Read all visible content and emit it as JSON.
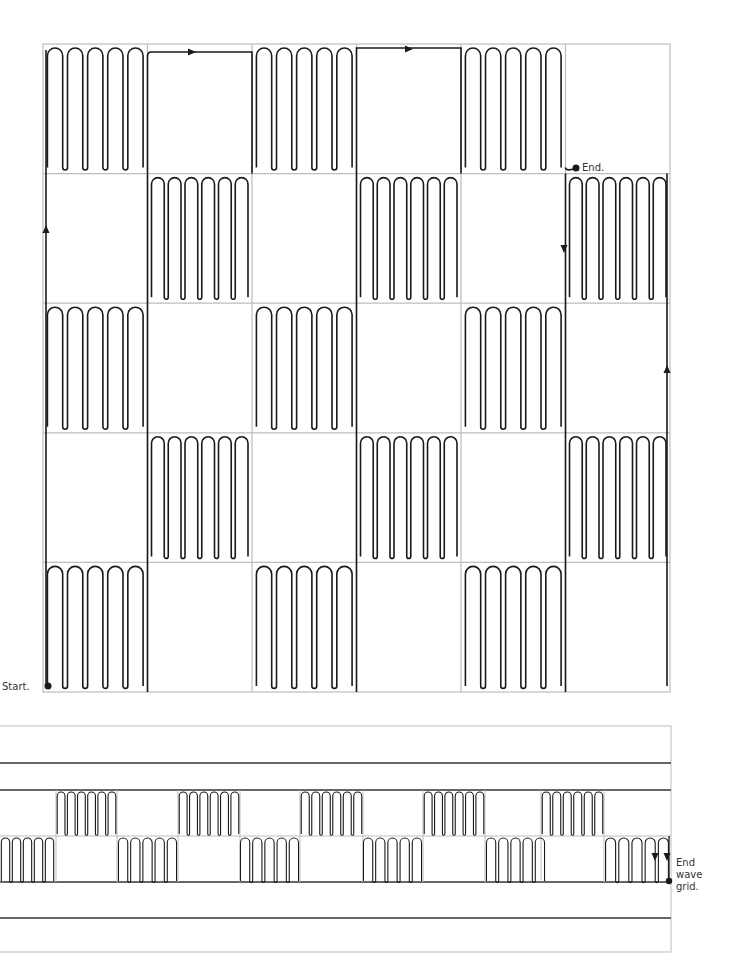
{
  "colors": {
    "grid": "#bdbdbd",
    "wave": "#1a1a1a",
    "strip_line": "#333333",
    "frame": "#c8c8c8",
    "background": "#ffffff"
  },
  "labels": {
    "start": "Start.",
    "end": "End.",
    "end_wave_grid": "End wave grid."
  },
  "main_grid": {
    "x": 43,
    "y": 44,
    "width": 627,
    "height": 648,
    "cols": 6,
    "rows": 5,
    "wave_pattern": [
      [
        1,
        0,
        1,
        0,
        1,
        0
      ],
      [
        0,
        1,
        0,
        1,
        0,
        1
      ],
      [
        1,
        0,
        1,
        0,
        1,
        0
      ],
      [
        0,
        1,
        0,
        1,
        0,
        1
      ],
      [
        1,
        0,
        1,
        0,
        1,
        0
      ]
    ],
    "loops_per_cell": 5,
    "start_point": [
      48,
      686
    ],
    "end_point": [
      576,
      168
    ],
    "arrows": [
      {
        "x": 46,
        "y": 230,
        "dir": "up"
      },
      {
        "x": 191,
        "y": 52,
        "dir": "right"
      },
      {
        "x": 408,
        "y": 49,
        "dir": "right"
      },
      {
        "x": 564,
        "y": 248,
        "dir": "down"
      },
      {
        "x": 667,
        "y": 370,
        "dir": "up"
      }
    ]
  },
  "wave_strip": {
    "frame": {
      "x": 0,
      "y": 726,
      "width": 671,
      "height": 226
    },
    "lines_y": [
      763,
      790,
      882,
      918
    ],
    "mid_y": 836,
    "upper_blocks_x": [
      [
        56,
        117
      ],
      [
        178,
        240
      ],
      [
        300,
        363
      ],
      [
        423,
        485
      ],
      [
        541,
        604
      ]
    ],
    "lower_blocks_x": [
      [
        0,
        55
      ],
      [
        117,
        178
      ],
      [
        239,
        300
      ],
      [
        362,
        423
      ],
      [
        485,
        546
      ],
      [
        604,
        670
      ]
    ],
    "end_point": [
      669,
      881
    ],
    "arrows": [
      {
        "x": 655,
        "y": 856,
        "dir": "down"
      },
      {
        "x": 667,
        "y": 856,
        "dir": "down"
      }
    ]
  }
}
